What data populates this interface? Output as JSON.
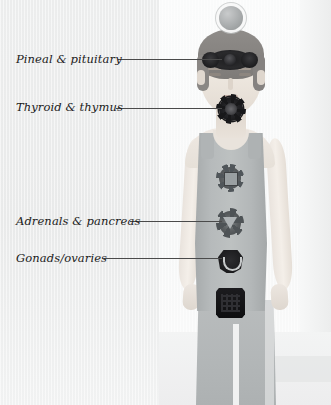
{
  "image": {
    "title": "Endocrine glands and chakra centers diagram",
    "subject": "standing human figure, front view, cropped at shins"
  },
  "annotations": [
    {
      "id": "pineal-pituitary",
      "label": "Pineal & pituitary",
      "chakra": "third-eye-chakra",
      "label_x": 16,
      "label_y": 52,
      "line_x": 118,
      "line_y": 59,
      "line_width": 104
    },
    {
      "id": "thyroid-thymus",
      "label": "Thyroid & thymus",
      "chakra": "throat-chakra",
      "label_x": 16,
      "label_y": 98,
      "line_x": 116,
      "line_y": 108,
      "line_width": 106
    },
    {
      "id": "adrenals-pancreas",
      "label": "Adrenals & pancreas",
      "chakra": "solar-plexus-chakra",
      "label_x": 16,
      "label_y": 214,
      "line_x": 130,
      "line_y": 221,
      "line_width": 92
    },
    {
      "id": "gonads-ovaries",
      "label": "Gonads/ovaries",
      "chakra": "sacral-chakra",
      "label_x": 16,
      "label_y": 250,
      "line_x": 104,
      "line_y": 258,
      "line_width": 118
    }
  ],
  "chakras": [
    {
      "id": "crown",
      "name": "crown-chakra-orb",
      "shape": "sphere with halo ring",
      "color": "#a9acad"
    },
    {
      "id": "third-eye",
      "name": "third-eye-chakra",
      "shape": "winged oval rosette",
      "color": "#1d1d1f"
    },
    {
      "id": "throat",
      "name": "throat-chakra",
      "shape": "toothed circle",
      "color": "#232326"
    },
    {
      "id": "heart",
      "name": "heart-chakra",
      "shape": "rayed circle",
      "color": "#5d6163"
    },
    {
      "id": "solar",
      "name": "solar-plexus-chakra",
      "shape": "rayed circle with downward triangle",
      "color": "#5a5e60"
    },
    {
      "id": "sacral",
      "name": "sacral-chakra",
      "shape": "hexagonal lotus with crescent",
      "color": "#1d1d20"
    },
    {
      "id": "root",
      "name": "root-chakra",
      "shape": "square yantra",
      "color": "#141416"
    }
  ],
  "palette": {
    "background_left": "#eaebeb",
    "background_right": "#f8f9f9",
    "garment_top": "#b6babb",
    "trousers": "#b3b7b8",
    "skin": "#ece5dd",
    "hair": "#85827f",
    "leader_line": "#4a4a4a",
    "label_text": "#1b1b1b"
  }
}
